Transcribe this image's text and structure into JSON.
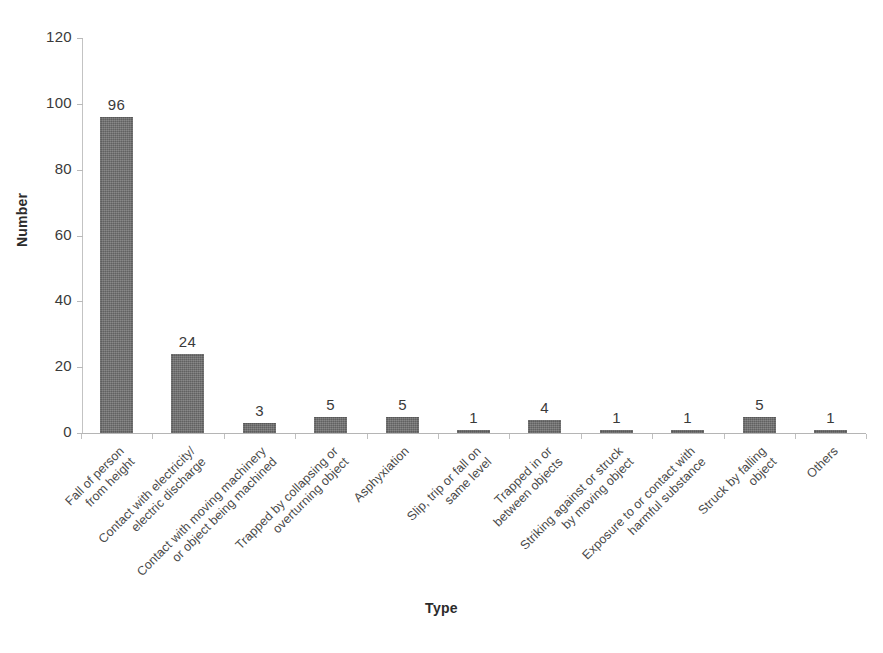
{
  "chart_data": {
    "type": "bar",
    "title": "",
    "xlabel": "Type",
    "ylabel": "Number",
    "ylim": [
      0,
      120
    ],
    "ytick_step": 20,
    "yticks": [
      0,
      20,
      40,
      60,
      80,
      100,
      120
    ],
    "grid": false,
    "legend": null,
    "bar_color": "#6e6e6e",
    "value_labels": true,
    "categories": [
      "Fall of person\nfrom height",
      "Contact with electricity/\nelectric discharge",
      "Contact with moving machinery\nor object being machined",
      "Trapped by collapsing or\noverturning object",
      "Asphyxiation",
      "Slip, trip or fall on\nsame level",
      "Trapped in or\nbetween objects",
      "Striking against or struck\nby moving object",
      "Exposure to or contact with\nharmful substance",
      "Struck by falling\nobject",
      "Others"
    ],
    "values": [
      96,
      24,
      3,
      5,
      5,
      1,
      4,
      1,
      1,
      5,
      1
    ]
  },
  "axes": {
    "y_title": "Number",
    "x_title": "Type",
    "y_tick_labels": [
      "120",
      "100",
      "80",
      "60",
      "40",
      "20",
      "0"
    ]
  }
}
